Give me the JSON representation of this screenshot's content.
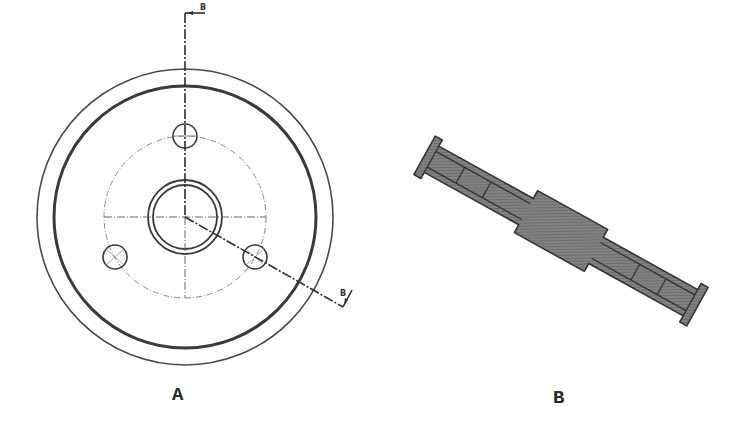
{
  "figure": {
    "type": "engineering-drawing",
    "views": [
      {
        "id": "A",
        "label": "A",
        "kind": "front-view",
        "features": [
          "outer-rim",
          "inner-rim",
          "bolt-circle",
          "hub",
          "bore",
          "bolt-holes-3"
        ]
      },
      {
        "id": "B",
        "label": "B",
        "kind": "section-view-B-B"
      }
    ],
    "cutting_plane": {
      "label_start": "B",
      "label_end": "B"
    }
  },
  "colors": {
    "line": "#3a3a3a",
    "centerline": "#6a6a6a",
    "section_fill": "#7d7d7d",
    "section_hatch": "#5e5e5e",
    "background": "#ffffff"
  }
}
